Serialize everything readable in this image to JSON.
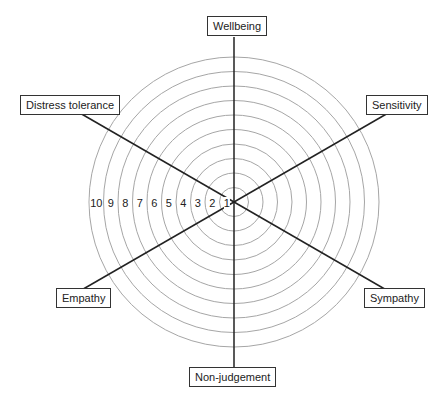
{
  "diagram": {
    "type": "radar-wheel",
    "center": [
      234,
      202
    ],
    "ring_count": 10,
    "outer_radius": 145,
    "ring_color": "#a6a6a6",
    "axis_color": "#222222",
    "ring_numbers": [
      "1",
      "2",
      "3",
      "4",
      "5",
      "6",
      "7",
      "8",
      "9",
      "10"
    ],
    "axes": [
      {
        "label": "Wellbeing",
        "angle": 90
      },
      {
        "label": "Sensitivity",
        "angle": 30
      },
      {
        "label": "Sympathy",
        "angle": -30
      },
      {
        "label": "Non-judgement",
        "angle": -90
      },
      {
        "label": "Empathy",
        "angle": -150
      },
      {
        "label": "Distress tolerance",
        "angle": 150
      }
    ]
  },
  "labels": {
    "wellbeing": "Wellbeing",
    "sensitivity": "Sensitivity",
    "sympathy": "Sympathy",
    "non_judgement": "Non-judgement",
    "empathy": "Empathy",
    "distress_tolerance": "Distress tolerance"
  }
}
